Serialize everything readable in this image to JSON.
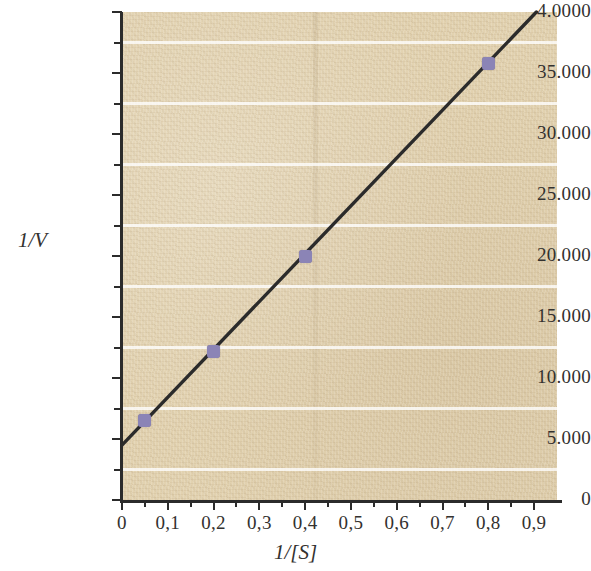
{
  "chart_data": {
    "type": "scatter",
    "title": "",
    "subtitle": "",
    "xlabel": "1/[S]",
    "ylabel": "1/V",
    "xlim": [
      0,
      0.95
    ],
    "ylim": [
      0,
      40
    ],
    "grid": true,
    "legend": null,
    "x_tick_labels": [
      "0",
      "0,1",
      "0,2",
      "0,3",
      "0,4",
      "0,5",
      "0,6",
      "0,7",
      "0,8",
      "0,9"
    ],
    "x_tick_values": [
      0,
      0.1,
      0.2,
      0.3,
      0.4,
      0.5,
      0.6,
      0.7,
      0.8,
      0.9
    ],
    "x_minor_tick_values": [
      0.05,
      0.15,
      0.25,
      0.35,
      0.45,
      0.55,
      0.65,
      0.75,
      0.85
    ],
    "y_tick_labels": [
      "0",
      "5.000",
      "10.000",
      "15.000",
      "20.000",
      "25.000",
      "30.000",
      "35.000",
      "4.0000"
    ],
    "y_tick_values": [
      0,
      5,
      10,
      15,
      20,
      25,
      30,
      35,
      40
    ],
    "y_minor_tick_values": [
      2.5,
      7.5,
      12.5,
      17.5,
      22.5,
      27.5,
      32.5,
      37.5
    ],
    "gridline_values": [
      2.5,
      7.5,
      12.5,
      17.5,
      22.5,
      27.5,
      32.5,
      37.5
    ],
    "series": [
      {
        "name": "data points",
        "marker_color": "#8b84b6",
        "x": [
          0.05,
          0.2,
          0.4,
          0.8
        ],
        "y": [
          6.5,
          12.2,
          20.0,
          35.8
        ]
      },
      {
        "name": "fit line",
        "line_color": "#2b2b2b",
        "intercept": 4.5,
        "slope": 39.2,
        "x": [
          0,
          0.905
        ],
        "y": [
          4.5,
          40.0
        ]
      }
    ],
    "colors": {
      "plot_background": "#e2d2b0",
      "gridline": "#ffffff",
      "axis": "#2b2b2b",
      "marker": "#8b84b6",
      "line": "#2b2b2b",
      "text": "#33312f"
    }
  }
}
